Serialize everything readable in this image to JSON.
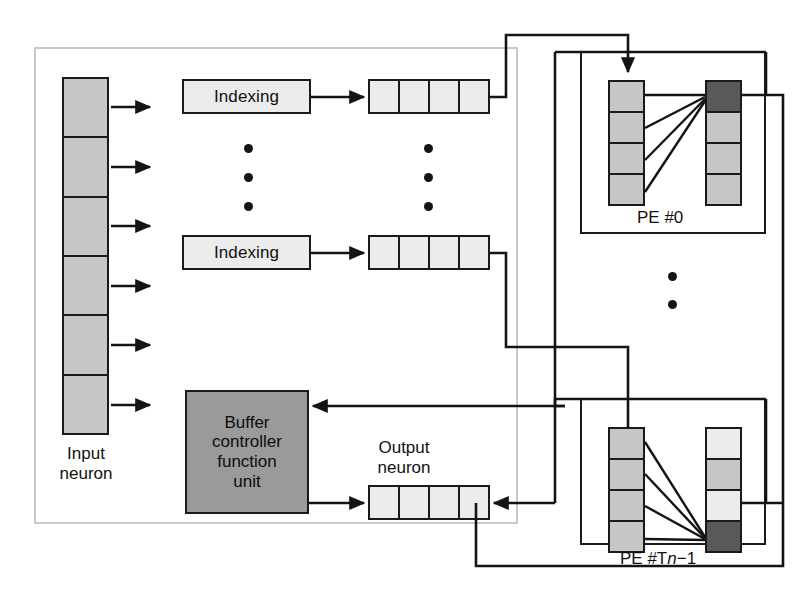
{
  "diagram": {
    "outer_block_label": "input/output neuron buffer block",
    "labels": {
      "input_neuron": "Input\nneuron",
      "output_neuron": "Output\nneuron",
      "buffer_controller": "Buffer\ncontroller\nfunction\nunit",
      "indexing_top": "Indexing",
      "indexing_bottom": "Indexing",
      "pe_first": "PE #0",
      "pe_last_prefix": "PE #T",
      "pe_last_italic": "n",
      "pe_last_suffix": "−1",
      "vertical_ellipsis": "•"
    },
    "colors": {
      "outline": "#1a1a1a",
      "frame": "#c9c9c9",
      "cell_mid": "#c6c6c6",
      "cell_light": "#ececec",
      "cell_dark": "#595959",
      "block_dark": "#9a9a9a",
      "background": "#ffffff"
    },
    "structures": {
      "input_neuron_cells": 6,
      "indexing_vector_cells": 4,
      "output_neuron_cells": 4,
      "pe_left_column_cells": 4,
      "pe_right_column_cells": 4,
      "pe_count_shown": 2,
      "ellipsis_dots_per_group": 3,
      "synapse_lines_per_pe": 4,
      "pe0_active_cell_index": 0,
      "pe_last_active_cell_index": 3,
      "input_arrows": 6
    }
  }
}
